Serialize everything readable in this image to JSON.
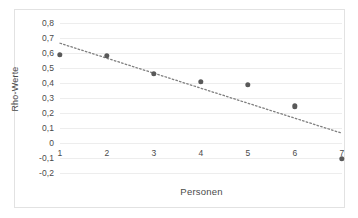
{
  "chart_data": {
    "type": "scatter",
    "title": "",
    "xlabel": "Personen",
    "ylabel": "Rho-Werte",
    "x": [
      1,
      2,
      3,
      4,
      5,
      6,
      7
    ],
    "values": [
      0.59,
      0.58,
      0.46,
      0.41,
      0.39,
      0.245,
      -0.105
    ],
    "xlim": [
      1,
      7
    ],
    "ylim": [
      -0.2,
      0.8
    ],
    "ytick_labels": [
      "0,8",
      "0,7",
      "0,6",
      "0,5",
      "0,4",
      "0,3",
      "0,2",
      "0,1",
      "0",
      "-0,1",
      "-0,2"
    ],
    "ytick_values": [
      0.8,
      0.7,
      0.6,
      0.5,
      0.4,
      0.3,
      0.2,
      0.1,
      0,
      -0.1,
      -0.2
    ],
    "xtick_labels": [
      "1",
      "2",
      "3",
      "4",
      "5",
      "6",
      "7"
    ],
    "grid": "horizontal",
    "legend": "none",
    "series": [
      {
        "name": "Rho-Werte",
        "marker": "circle",
        "color": "#595959",
        "values": [
          0.59,
          0.58,
          0.46,
          0.41,
          0.39,
          0.245,
          -0.105
        ]
      }
    ],
    "trendline": {
      "style": "dotted",
      "color": "#7f7f7f",
      "x_start": 1,
      "y_start": 0.665,
      "x_end": 7,
      "y_end": 0.065
    },
    "colors": {
      "marker": "#595959",
      "trendline": "#7f7f7f",
      "gridline": "#ededed",
      "border": "#e2e2e2",
      "text": "#4a4a4a",
      "background": "#ffffff"
    }
  }
}
